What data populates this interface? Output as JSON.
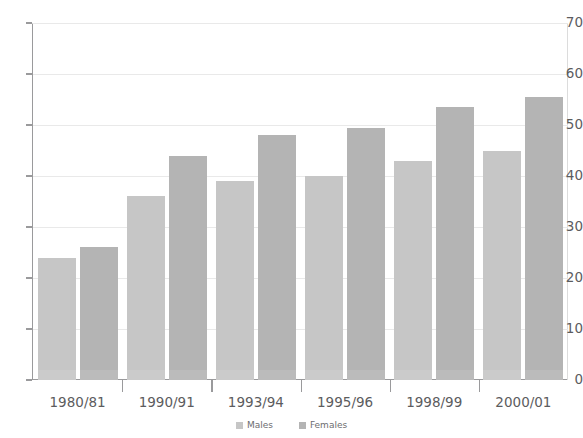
{
  "chart_data": {
    "type": "bar",
    "title": "",
    "subtitle": "",
    "xlabel": "",
    "ylabel": "",
    "categories": [
      "1980/81",
      "1990/91",
      "1993/94",
      "1995/96",
      "1998/99",
      "2000/01"
    ],
    "series": [
      {
        "name": "Males",
        "color": "#c6c6c6",
        "values": [
          24,
          36,
          39,
          40,
          43,
          45
        ]
      },
      {
        "name": "Females",
        "color": "#b4b4b4",
        "values": [
          26,
          44,
          48,
          49.5,
          53.5,
          55.5
        ]
      }
    ],
    "ylim": [
      0,
      70
    ],
    "yticks": [
      0,
      10,
      20,
      30,
      40,
      50,
      60,
      70
    ],
    "ytick_labels": [
      "0",
      "10",
      "20",
      "30",
      "40",
      "50",
      "60",
      "70"
    ],
    "grid": true,
    "grid_axis": "y",
    "legend_position": "bottom-center",
    "annotations": []
  },
  "legend": {
    "items": [
      {
        "label": "Males",
        "color": "#c6c6c6"
      },
      {
        "label": "Females",
        "color": "#b4b4b4"
      }
    ]
  },
  "colors": {
    "males": "#c6c6c6",
    "females": "#b4b4b4",
    "axis": "#9a9a9c",
    "grid": "#e9e9e9",
    "text": "#5c5c5e",
    "background": "#ffffff"
  }
}
